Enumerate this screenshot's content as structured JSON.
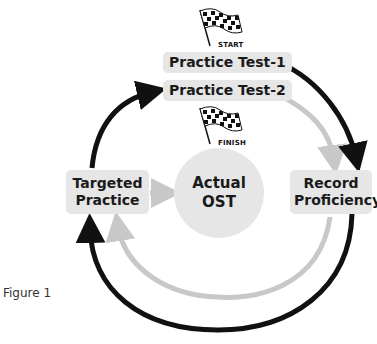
{
  "diagram": {
    "start_flag": {
      "icon": "checkered-flag-icon",
      "label": "START"
    },
    "finish_flag": {
      "icon": "checkered-flag-icon",
      "label": "FINISH"
    },
    "nodes": {
      "practice_test_1": "Practice Test-1",
      "practice_test_2": "Practice Test-2",
      "targeted_practice": {
        "line1": "Targeted",
        "line2": "Practice"
      },
      "actual_ost": {
        "line1": "Actual",
        "line2": "OST"
      },
      "record_proficiency": {
        "line1": "Record",
        "line2": "Proficiency"
      }
    },
    "edges": [
      {
        "from": "Practice Test-1",
        "to": "Record Proficiency",
        "style": "black"
      },
      {
        "from": "Record Proficiency",
        "to": "Targeted Practice",
        "style": "black",
        "path": "outer bottom arc"
      },
      {
        "from": "Targeted Practice",
        "to": "Practice Test-2",
        "style": "black"
      },
      {
        "from": "Practice Test-2",
        "to": "Record Proficiency",
        "style": "grey"
      },
      {
        "from": "Record Proficiency",
        "to": "Targeted Practice",
        "style": "grey",
        "path": "inner bottom arc"
      },
      {
        "from": "Targeted Practice",
        "to": "Actual OST",
        "style": "grey"
      }
    ],
    "colors": {
      "dark_arrow": "#111111",
      "light_arrow": "#c8c8c8",
      "node_fill": "#e6e6e6",
      "text": "#1a1a1a"
    },
    "caption": "Figure 1"
  }
}
